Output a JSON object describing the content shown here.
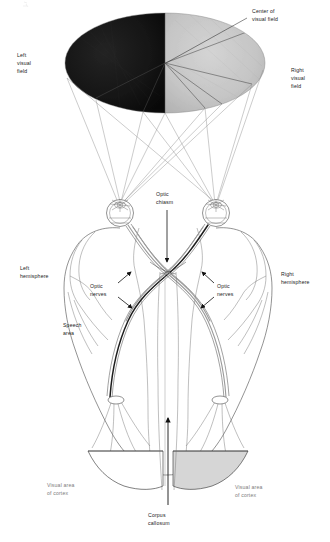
{
  "figure": {
    "type": "anatomical-diagram"
  },
  "visual_field": {
    "left_label": "Left\nvisual\nfield",
    "left_label_lines": [
      "Left",
      "visual",
      "field"
    ],
    "right_label_lines": [
      "Right",
      "visual",
      "field"
    ],
    "center_label_lines": [
      "Center of",
      "visual field"
    ],
    "left_half_color": "#151515",
    "right_half_color": "#c6c6c6"
  },
  "pathway": {
    "chiasm_lines": [
      "Optic",
      "chiasm"
    ],
    "optic_nerves_left_lines": [
      "Optic",
      "nerves"
    ],
    "optic_nerves_right_lines": [
      "Optic",
      "nerves"
    ]
  },
  "brain": {
    "left_hemisphere_lines": [
      "Left",
      "hemisphere"
    ],
    "right_hemisphere_lines": [
      "Right",
      "hemisphere"
    ],
    "speech_area_lines": [
      "Speech",
      "area"
    ],
    "visual_cortex_left_lines": [
      "Visual area",
      "of cortex"
    ],
    "visual_cortex_right_lines": [
      "Visual area",
      "of cortex"
    ],
    "corpus_callosum_lines": [
      "Corpus",
      "callosum"
    ],
    "right_cortex_shade": "#d6d6d6"
  }
}
